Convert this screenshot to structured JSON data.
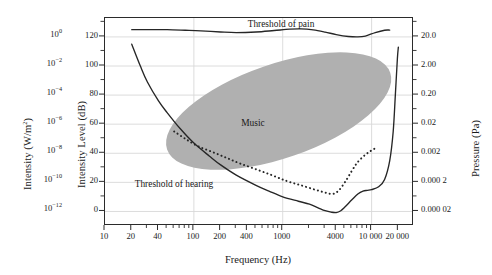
{
  "figure": {
    "type": "audibility-curve-chart",
    "background": "#ffffff",
    "frame_color": "#2b2b2b",
    "grid_color": "#d8d8d8",
    "music_fill": "#b0b0b0",
    "curve_color": "#262626"
  },
  "axes": {
    "x": {
      "label": "Frequency (Hz)",
      "scale": "log",
      "range": [
        10,
        30000
      ],
      "ticks": [
        {
          "value": 10,
          "label": "10"
        },
        {
          "value": 20,
          "label": "20"
        },
        {
          "value": 40,
          "label": "40"
        },
        {
          "value": 100,
          "label": "100"
        },
        {
          "value": 200,
          "label": "200"
        },
        {
          "value": 400,
          "label": "400"
        },
        {
          "value": 1000,
          "label": "1000"
        },
        {
          "value": 4000,
          "label": "4000"
        },
        {
          "value": 10000,
          "label": "10 000"
        },
        {
          "value": 20000,
          "label": "20 000"
        }
      ],
      "minor_ticks": [
        30,
        50,
        60,
        70,
        80,
        90,
        300,
        500,
        600,
        700,
        800,
        900,
        2000,
        3000,
        5000,
        6000,
        7000,
        8000,
        9000
      ],
      "gridlines": [
        100,
        1000,
        10000
      ]
    },
    "y_left_inner": {
      "label": "Intensity Level (dB)",
      "scale": "linear",
      "range": [
        -10,
        133
      ],
      "ticks": [
        {
          "value": 0,
          "label": "0"
        },
        {
          "value": 20,
          "label": "20"
        },
        {
          "value": 40,
          "label": "40"
        },
        {
          "value": 60,
          "label": "60"
        },
        {
          "value": 80,
          "label": "80"
        },
        {
          "value": 100,
          "label": "100"
        },
        {
          "value": 120,
          "label": "120"
        }
      ],
      "minor_ticks": [
        10,
        30,
        50,
        70,
        90,
        110,
        130
      ],
      "gridlines": [
        0,
        20,
        40,
        60,
        80,
        100,
        120
      ]
    },
    "y_left_outer": {
      "label": "Intensity (W/m",
      "label_exponent": "2",
      "label_suffix": ")",
      "scale": "log",
      "ticks": [
        {
          "db": 120,
          "mantissa": "10",
          "exponent": "0"
        },
        {
          "db": 100,
          "mantissa": "10",
          "exponent": "−2"
        },
        {
          "db": 80,
          "mantissa": "10",
          "exponent": "−4"
        },
        {
          "db": 60,
          "mantissa": "10",
          "exponent": "−6"
        },
        {
          "db": 40,
          "mantissa": "10",
          "exponent": "−8"
        },
        {
          "db": 20,
          "mantissa": "10",
          "exponent": "−10"
        },
        {
          "db": 0,
          "mantissa": "10",
          "exponent": "−12"
        }
      ]
    },
    "y_right": {
      "label": "Pressure (Pa)",
      "scale": "log",
      "ticks": [
        {
          "db": 120,
          "label": "20.0"
        },
        {
          "db": 100,
          "label": "2.00"
        },
        {
          "db": 80,
          "label": "0.20"
        },
        {
          "db": 60,
          "label": "0.02"
        },
        {
          "db": 40,
          "label": "0.002"
        },
        {
          "db": 20,
          "label": "0.000 2"
        },
        {
          "db": 0,
          "label": "0.000 02"
        }
      ]
    }
  },
  "annotations": {
    "threshold_of_pain": "Threshold of pain",
    "threshold_of_hearing": "Threshold of hearing",
    "music": "Music"
  },
  "chart_data": {
    "type": "line",
    "title": "",
    "xlabel": "Frequency (Hz)",
    "ylabel": "Intensity Level (dB)",
    "xlim": [
      10,
      30000
    ],
    "ylim": [
      -10,
      133
    ],
    "xscale": "log",
    "grid": true,
    "legend": "none",
    "series": [
      {
        "name": "Threshold of pain",
        "style": "solid",
        "points": [
          [
            20,
            125
          ],
          [
            30,
            125
          ],
          [
            50,
            125
          ],
          [
            80,
            124.6
          ],
          [
            120,
            124.2
          ],
          [
            200,
            123.4
          ],
          [
            300,
            123.0
          ],
          [
            500,
            123.4
          ],
          [
            800,
            124.4
          ],
          [
            1200,
            125.3
          ],
          [
            1600,
            125.5
          ],
          [
            2200,
            124.8
          ],
          [
            3000,
            123.3
          ],
          [
            4000,
            121.6
          ],
          [
            5500,
            120.3
          ],
          [
            7000,
            120.0
          ],
          [
            8500,
            120.6
          ],
          [
            11000,
            123.0
          ],
          [
            14000,
            124.6
          ],
          [
            16000,
            124.7
          ]
        ]
      },
      {
        "name": "Threshold of hearing",
        "style": "solid",
        "points": [
          [
            20,
            115
          ],
          [
            25,
            100
          ],
          [
            30,
            89
          ],
          [
            40,
            76
          ],
          [
            50,
            68
          ],
          [
            70,
            57
          ],
          [
            100,
            47
          ],
          [
            150,
            38
          ],
          [
            200,
            32
          ],
          [
            300,
            25
          ],
          [
            500,
            18
          ],
          [
            700,
            14
          ],
          [
            1000,
            10
          ],
          [
            1500,
            7
          ],
          [
            2000,
            5
          ],
          [
            2500,
            2.5
          ],
          [
            3000,
            0.5
          ],
          [
            3500,
            -0.5
          ],
          [
            4000,
            -0.8
          ],
          [
            4500,
            0.5
          ],
          [
            5000,
            3
          ],
          [
            6000,
            8
          ],
          [
            7000,
            12
          ],
          [
            8000,
            14
          ],
          [
            9000,
            14.5
          ],
          [
            10000,
            15
          ],
          [
            12000,
            17
          ],
          [
            14000,
            22
          ],
          [
            16000,
            35
          ],
          [
            17500,
            55
          ],
          [
            18500,
            80
          ],
          [
            19500,
            105
          ],
          [
            20000,
            113
          ]
        ]
      },
      {
        "name": "Speech",
        "style": "dotted",
        "points": [
          [
            60,
            55
          ],
          [
            80,
            50
          ],
          [
            110,
            45
          ],
          [
            160,
            41
          ],
          [
            230,
            37
          ],
          [
            330,
            33
          ],
          [
            500,
            29
          ],
          [
            750,
            25
          ],
          [
            1100,
            21
          ],
          [
            1600,
            18
          ],
          [
            2300,
            15
          ],
          [
            3000,
            13
          ],
          [
            3600,
            12
          ],
          [
            4200,
            14
          ],
          [
            5000,
            20
          ],
          [
            6000,
            28
          ],
          [
            7000,
            34
          ],
          [
            8500,
            39
          ],
          [
            10000,
            42
          ],
          [
            11500,
            44
          ]
        ]
      }
    ],
    "regions": [
      {
        "name": "Music",
        "shape": "tilted-ellipse",
        "fill": "#b0b0b0",
        "approx_frequency_range": [
          40,
          11500
        ],
        "approx_level_range": [
          38,
          100
        ],
        "center_frequency": 900,
        "center_level": 69
      }
    ]
  }
}
